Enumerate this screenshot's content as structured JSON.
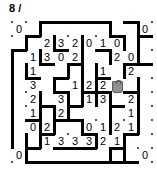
{
  "header": {
    "label": "8 /"
  },
  "puzzle": {
    "type": "slitherlink",
    "grid_cols": 10,
    "grid_rows": 10,
    "cell_size": 14,
    "origin_x": 12,
    "origin_y": 8,
    "colors": {
      "line": "#000000",
      "dot": "#1a1a1a",
      "clue_text": "#000000",
      "shaded_fill": "#8f8f8f",
      "shaded_stroke": "#5a5a5a",
      "background": "#ffffff"
    },
    "clues": [
      {
        "row": 0,
        "col": 0,
        "value": "0"
      },
      {
        "row": 0,
        "col": 9,
        "value": "0"
      },
      {
        "row": 1,
        "col": 2,
        "value": "2"
      },
      {
        "row": 1,
        "col": 3,
        "value": "3"
      },
      {
        "row": 1,
        "col": 4,
        "value": "2"
      },
      {
        "row": 1,
        "col": 5,
        "value": "0"
      },
      {
        "row": 1,
        "col": 6,
        "value": "1"
      },
      {
        "row": 1,
        "col": 7,
        "value": "0"
      },
      {
        "row": 2,
        "col": 1,
        "value": "1"
      },
      {
        "row": 2,
        "col": 2,
        "value": "3"
      },
      {
        "row": 2,
        "col": 3,
        "value": "0"
      },
      {
        "row": 2,
        "col": 4,
        "value": "2"
      },
      {
        "row": 2,
        "col": 7,
        "value": "2"
      },
      {
        "row": 2,
        "col": 8,
        "value": "0"
      },
      {
        "row": 3,
        "col": 1,
        "value": "1"
      },
      {
        "row": 3,
        "col": 6,
        "value": "1"
      },
      {
        "row": 3,
        "col": 8,
        "value": "2"
      },
      {
        "row": 4,
        "col": 1,
        "value": "3"
      },
      {
        "row": 4,
        "col": 4,
        "value": "1"
      },
      {
        "row": 4,
        "col": 5,
        "value": "2"
      },
      {
        "row": 4,
        "col": 6,
        "value": "2"
      },
      {
        "row": 5,
        "col": 1,
        "value": "2"
      },
      {
        "row": 5,
        "col": 3,
        "value": "3"
      },
      {
        "row": 5,
        "col": 5,
        "value": "1"
      },
      {
        "row": 5,
        "col": 6,
        "value": "3"
      },
      {
        "row": 5,
        "col": 8,
        "value": "2"
      },
      {
        "row": 6,
        "col": 1,
        "value": "1"
      },
      {
        "row": 6,
        "col": 3,
        "value": "2"
      },
      {
        "row": 6,
        "col": 8,
        "value": "1"
      },
      {
        "row": 7,
        "col": 1,
        "value": "0"
      },
      {
        "row": 7,
        "col": 2,
        "value": "2"
      },
      {
        "row": 7,
        "col": 5,
        "value": "0"
      },
      {
        "row": 7,
        "col": 6,
        "value": "1"
      },
      {
        "row": 7,
        "col": 7,
        "value": "2"
      },
      {
        "row": 7,
        "col": 8,
        "value": "1"
      },
      {
        "row": 8,
        "col": 2,
        "value": "1"
      },
      {
        "row": 8,
        "col": 3,
        "value": "3"
      },
      {
        "row": 8,
        "col": 4,
        "value": "3"
      },
      {
        "row": 8,
        "col": 5,
        "value": "3"
      },
      {
        "row": 8,
        "col": 6,
        "value": "2"
      },
      {
        "row": 8,
        "col": 7,
        "value": "1"
      },
      {
        "row": 9,
        "col": 0,
        "value": "0"
      },
      {
        "row": 9,
        "col": 9,
        "value": "0"
      }
    ],
    "shaded_cells": [
      {
        "row": 4,
        "col": 7
      }
    ],
    "h_edges": [
      {
        "row": 0,
        "col": 2,
        "len": 5
      },
      {
        "row": 0,
        "col": 8,
        "len": 1
      },
      {
        "row": 1,
        "col": 1,
        "len": 1
      },
      {
        "row": 1,
        "col": 7,
        "len": 1
      },
      {
        "row": 1,
        "col": 9,
        "len": 1
      },
      {
        "row": 2,
        "col": 0,
        "len": 1
      },
      {
        "row": 2,
        "col": 3,
        "len": 1
      },
      {
        "row": 2,
        "col": 6,
        "len": 1
      },
      {
        "row": 3,
        "col": 2,
        "len": 1
      },
      {
        "row": 3,
        "col": 4,
        "len": 1
      },
      {
        "row": 3,
        "col": 8,
        "len": 2
      },
      {
        "row": 4,
        "col": 1,
        "len": 1
      },
      {
        "row": 4,
        "col": 3,
        "len": 1
      },
      {
        "row": 4,
        "col": 6,
        "len": 1
      },
      {
        "row": 5,
        "col": 3,
        "len": 1
      },
      {
        "row": 5,
        "col": 5,
        "len": 2
      },
      {
        "row": 5,
        "col": 8,
        "len": 1
      },
      {
        "row": 6,
        "col": 2,
        "len": 1
      },
      {
        "row": 6,
        "col": 4,
        "len": 1
      },
      {
        "row": 6,
        "col": 7,
        "len": 1
      },
      {
        "row": 7,
        "col": 1,
        "len": 1
      },
      {
        "row": 7,
        "col": 3,
        "len": 2
      },
      {
        "row": 8,
        "col": 2,
        "len": 1
      },
      {
        "row": 8,
        "col": 5,
        "len": 1
      },
      {
        "row": 8,
        "col": 8,
        "len": 1
      },
      {
        "row": 9,
        "col": 1,
        "len": 1
      },
      {
        "row": 9,
        "col": 3,
        "len": 3
      },
      {
        "row": 9,
        "col": 7,
        "len": 1
      },
      {
        "row": 10,
        "col": 1,
        "len": 7
      },
      {
        "row": 10,
        "col": 8,
        "len": 1
      }
    ],
    "v_edges": [
      {
        "row": 0,
        "col": 2,
        "len": 1
      },
      {
        "row": 0,
        "col": 7,
        "len": 1
      },
      {
        "row": 0,
        "col": 9,
        "len": 2
      },
      {
        "row": 1,
        "col": 1,
        "len": 1
      },
      {
        "row": 1,
        "col": 3,
        "len": 1
      },
      {
        "row": 1,
        "col": 5,
        "len": 1
      },
      {
        "row": 1,
        "col": 8,
        "len": 1
      },
      {
        "row": 2,
        "col": 0,
        "len": 5
      },
      {
        "row": 2,
        "col": 2,
        "len": 1
      },
      {
        "row": 2,
        "col": 5,
        "len": 4
      },
      {
        "row": 2,
        "col": 7,
        "len": 1
      },
      {
        "row": 2,
        "col": 9,
        "len": 1
      },
      {
        "row": 3,
        "col": 1,
        "len": 1
      },
      {
        "row": 3,
        "col": 4,
        "len": 1
      },
      {
        "row": 3,
        "col": 6,
        "len": 1
      },
      {
        "row": 3,
        "col": 8,
        "len": 1
      },
      {
        "row": 4,
        "col": 3,
        "len": 1
      },
      {
        "row": 4,
        "col": 6,
        "len": 2
      },
      {
        "row": 4,
        "col": 9,
        "len": 1
      },
      {
        "row": 5,
        "col": 2,
        "len": 2
      },
      {
        "row": 5,
        "col": 4,
        "len": 1
      },
      {
        "row": 5,
        "col": 7,
        "len": 3
      },
      {
        "row": 5,
        "col": 9,
        "len": 3
      },
      {
        "row": 6,
        "col": 3,
        "len": 1
      },
      {
        "row": 6,
        "col": 4,
        "len": 1
      },
      {
        "row": 7,
        "col": 0,
        "len": 2
      },
      {
        "row": 7,
        "col": 2,
        "len": 1
      },
      {
        "row": 7,
        "col": 3,
        "len": 1
      },
      {
        "row": 7,
        "col": 5,
        "len": 1
      },
      {
        "row": 8,
        "col": 1,
        "len": 1
      },
      {
        "row": 8,
        "col": 2,
        "len": 1
      },
      {
        "row": 8,
        "col": 6,
        "len": 1
      },
      {
        "row": 8,
        "col": 8,
        "len": 1
      },
      {
        "row": 9,
        "col": 1,
        "len": 1
      },
      {
        "row": 9,
        "col": 7,
        "len": 1
      },
      {
        "row": 9,
        "col": 8,
        "len": 1
      }
    ]
  }
}
